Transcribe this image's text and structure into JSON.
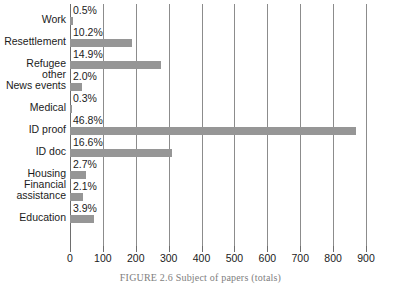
{
  "chart_data": {
    "type": "bar",
    "orientation": "horizontal",
    "title": "",
    "xlabel": "",
    "ylabel": "",
    "xlim": [
      0,
      900
    ],
    "xticks": [
      0,
      100,
      200,
      300,
      400,
      500,
      600,
      700,
      800,
      900
    ],
    "grid": true,
    "legend": null,
    "bar_color": "#969696",
    "gridline_color": "#8c8c8c",
    "categories": [
      "Work",
      "Resettlement",
      "Refugee other",
      "News events",
      "Medical",
      "ID proof",
      "ID doc",
      "Housing",
      "Financial\nassistance",
      "Education"
    ],
    "values": [
      9,
      190,
      277,
      37,
      6,
      871,
      309,
      50,
      39,
      73
    ],
    "data_labels": [
      "0.5%",
      "10.2%",
      "14.9%",
      "2.0%",
      "0.3%",
      "46.8%",
      "16.6%",
      "2.7%",
      "2.1%",
      "3.9%"
    ]
  },
  "caption": "FIGURE 2.6 Subject of papers (totals)"
}
